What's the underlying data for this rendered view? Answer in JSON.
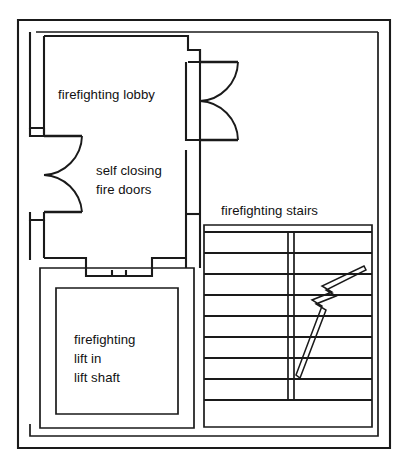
{
  "drawing": {
    "type": "architectural-floor-plan",
    "subject": "firefighting shaft plan",
    "background_color": "#ffffff",
    "line_color": "#1a1a1a"
  },
  "labels": {
    "lobby": "firefighting lobby",
    "fire_doors_line1": "self closing",
    "fire_doors_line2": "fire doors",
    "stairs": "firefighting stairs",
    "lift_line1": "firefighting",
    "lift_line2": "lift in",
    "lift_line3": "lift shaft"
  },
  "spaces": [
    {
      "name": "firefighting lobby",
      "position": "upper-left"
    },
    {
      "name": "firefighting stairs",
      "position": "right"
    },
    {
      "name": "firefighting lift in lift shaft",
      "position": "lower-left"
    }
  ],
  "elements": {
    "outer_wall": "double-line building envelope",
    "door_count": 2,
    "door_type": "self closing fire door, single leaf, 90 degree swing arc",
    "stair_tread_count": 9,
    "stair_has_central_spine": true,
    "stair_direction_marker": "diagonal arrow with zigzag break symbol",
    "lift_doors": "two-leaf sliding lift landing doors",
    "lift_shaft_wall": "double-line shaft enclosure"
  },
  "geometry": {
    "canvas": {
      "width": 408,
      "height": 466
    },
    "outer_wall_rect": {
      "x": 18,
      "y": 20,
      "width": 372,
      "height": 428
    },
    "outer_wall_inner_rect": {
      "x": 30,
      "y": 32,
      "width": 348,
      "height": 404
    },
    "stair_area": {
      "x": 204,
      "y": 225,
      "width": 168,
      "height": 202
    },
    "lift_shaft_outer": {
      "x": 40,
      "y": 268,
      "width": 154,
      "height": 160
    },
    "lift_shaft_inner": {
      "x": 56,
      "y": 288,
      "width": 122,
      "height": 126
    },
    "treads_y": [
      232,
      253,
      274,
      295,
      316,
      337,
      358,
      379,
      400
    ],
    "spine_x": 290
  }
}
